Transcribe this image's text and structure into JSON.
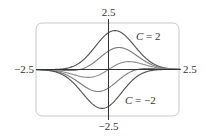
{
  "chart_data": {
    "type": "line",
    "title": "",
    "xlabel": "",
    "ylabel": "",
    "xlim": [
      -2.5,
      2.5
    ],
    "ylim": [
      -2.5,
      2.5
    ],
    "grid": false,
    "legend": "none",
    "function": "y = (x + C) e^(-x^2)",
    "tick_labels": {
      "x_left": "−2.5",
      "x_right": "2.5",
      "y_top": "2.5",
      "y_bottom": "−2.5"
    },
    "annotations": [
      {
        "text": "C = 2",
        "italic_part": "C",
        "rest": " = 2",
        "x": 1.05,
        "y": 1.78
      },
      {
        "text": "C = −2",
        "italic_part": "C",
        "rest": " = −2",
        "x": 0.72,
        "y": -1.7
      }
    ],
    "series": [
      {
        "name": "C = 2",
        "C": 2,
        "color": "#4d4d4d",
        "peak": {
          "x": 0.22,
          "y": 2.12
        }
      },
      {
        "name": "C = 1",
        "C": 1,
        "color": "#7a7a7a",
        "peak": {
          "x": 0.37,
          "y": 1.2
        }
      },
      {
        "name": "C = 0",
        "C": 0,
        "color": "#8c8c8c",
        "peak": {
          "x": 0.71,
          "y": 0.43
        }
      },
      {
        "name": "C = -1",
        "C": -1,
        "color": "#7a7a7a",
        "trough": {
          "x": -0.37,
          "y": -1.2
        }
      },
      {
        "name": "C = -2",
        "C": -2,
        "color": "#4d4d4d",
        "trough": {
          "x": -0.22,
          "y": -2.12
        }
      }
    ],
    "frame": {
      "color": "#c8c8c8",
      "rounded": true
    },
    "axis_color": "#333333"
  }
}
